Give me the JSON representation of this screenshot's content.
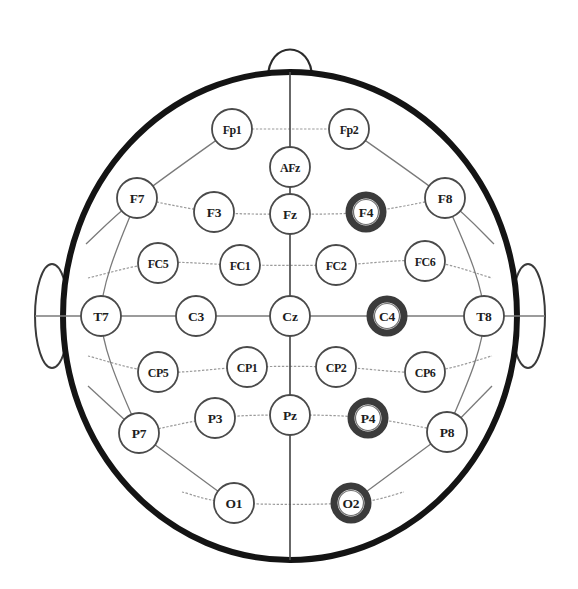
{
  "diagram": {
    "view": "top-down scalp map, nose at top",
    "colors": {
      "head_outline": "#141414",
      "electrode_stroke": "#4a4a4a",
      "electrode_fill": "#ffffff",
      "highlight_ring": "#3b3b3b",
      "grid_line": "#7a7a7a",
      "midline": "#4d4d4d",
      "label_text": "#1d1d1d",
      "background": "#ffffff"
    },
    "head": {
      "cx": 290,
      "cy": 316,
      "rx": 227,
      "ry": 244
    },
    "nose": {
      "cx": 290,
      "cy": 72,
      "width": 44,
      "height": 38
    },
    "ears": [
      {
        "name": "left-ear",
        "cx": 52,
        "cy": 316,
        "rx": 17,
        "ry": 52
      },
      {
        "name": "right-ear",
        "cx": 528,
        "cy": 316,
        "rx": 17,
        "ry": 52
      }
    ],
    "electrode_radius": 20,
    "highlighted_electrodes": [
      "F4",
      "C4",
      "P4",
      "O2"
    ],
    "electrodes": [
      {
        "id": "Fp1",
        "label": "Fp1",
        "x": 232,
        "y": 129,
        "highlighted": false,
        "row": "Fp"
      },
      {
        "id": "Fp2",
        "label": "Fp2",
        "x": 349,
        "y": 129,
        "highlighted": false,
        "row": "Fp"
      },
      {
        "id": "AFz",
        "label": "AFz",
        "x": 290,
        "y": 167,
        "highlighted": false,
        "row": "AF"
      },
      {
        "id": "F7",
        "label": "F7",
        "x": 137,
        "y": 198,
        "highlighted": false,
        "row": "F"
      },
      {
        "id": "F3",
        "label": "F3",
        "x": 214,
        "y": 212,
        "highlighted": false,
        "row": "F"
      },
      {
        "id": "Fz",
        "label": "Fz",
        "x": 290,
        "y": 214,
        "highlighted": false,
        "row": "F"
      },
      {
        "id": "F4",
        "label": "F4",
        "x": 366,
        "y": 212,
        "highlighted": true,
        "row": "F"
      },
      {
        "id": "F8",
        "label": "F8",
        "x": 445,
        "y": 198,
        "highlighted": false,
        "row": "F"
      },
      {
        "id": "FC5",
        "label": "FC5",
        "x": 158,
        "y": 263,
        "highlighted": false,
        "row": "FC"
      },
      {
        "id": "FC1",
        "label": "FC1",
        "x": 240,
        "y": 265,
        "highlighted": false,
        "row": "FC"
      },
      {
        "id": "FC2",
        "label": "FC2",
        "x": 336,
        "y": 265,
        "highlighted": false,
        "row": "FC"
      },
      {
        "id": "FC6",
        "label": "FC6",
        "x": 425,
        "y": 261,
        "highlighted": false,
        "row": "FC"
      },
      {
        "id": "T7",
        "label": "T7",
        "x": 101,
        "y": 316,
        "highlighted": false,
        "row": "C"
      },
      {
        "id": "C3",
        "label": "C3",
        "x": 196,
        "y": 316,
        "highlighted": false,
        "row": "C"
      },
      {
        "id": "Cz",
        "label": "Cz",
        "x": 290,
        "y": 316,
        "highlighted": false,
        "row": "C"
      },
      {
        "id": "C4",
        "label": "C4",
        "x": 387,
        "y": 316,
        "highlighted": true,
        "row": "C"
      },
      {
        "id": "T8",
        "label": "T8",
        "x": 484,
        "y": 316,
        "highlighted": false,
        "row": "C"
      },
      {
        "id": "CP5",
        "label": "CP5",
        "x": 158,
        "y": 372,
        "highlighted": false,
        "row": "CP"
      },
      {
        "id": "CP1",
        "label": "CP1",
        "x": 247,
        "y": 367,
        "highlighted": false,
        "row": "CP"
      },
      {
        "id": "CP2",
        "label": "CP2",
        "x": 336,
        "y": 367,
        "highlighted": false,
        "row": "CP"
      },
      {
        "id": "CP6",
        "label": "CP6",
        "x": 425,
        "y": 372,
        "highlighted": false,
        "row": "CP"
      },
      {
        "id": "P7",
        "label": "P7",
        "x": 139,
        "y": 433,
        "highlighted": false,
        "row": "P"
      },
      {
        "id": "P3",
        "label": "P3",
        "x": 215,
        "y": 418,
        "highlighted": false,
        "row": "P"
      },
      {
        "id": "Pz",
        "label": "Pz",
        "x": 290,
        "y": 415,
        "highlighted": false,
        "row": "P"
      },
      {
        "id": "P4",
        "label": "P4",
        "x": 368,
        "y": 418,
        "highlighted": true,
        "row": "P"
      },
      {
        "id": "P8",
        "label": "P8",
        "x": 447,
        "y": 432,
        "highlighted": false,
        "row": "P"
      },
      {
        "id": "O1",
        "label": "O1",
        "x": 234,
        "y": 503,
        "highlighted": false,
        "row": "O"
      },
      {
        "id": "O2",
        "label": "O2",
        "x": 351,
        "y": 503,
        "highlighted": true,
        "row": "O"
      }
    ]
  }
}
